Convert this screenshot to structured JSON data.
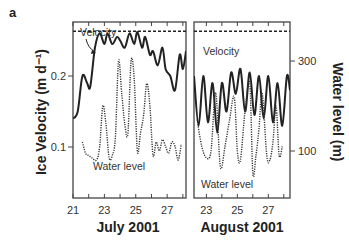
{
  "figure": {
    "panel_label": "a"
  },
  "chart_data": {
    "type": "line",
    "title": "",
    "panels": [
      {
        "name": "July 2001",
        "xlabel": "July 2001",
        "xticks": [
          21,
          23,
          25,
          27
        ],
        "xlim": [
          21,
          28.2
        ],
        "series": [
          {
            "name": "Velocity",
            "axis": "left",
            "style": "solid",
            "x": [
              21.0,
              21.3,
              21.6,
              21.9,
              22.1,
              22.4,
              22.7,
              23.0,
              23.2,
              23.5,
              23.8,
              24.0,
              24.3,
              24.6,
              24.9,
              25.1,
              25.4,
              25.6,
              25.9,
              26.1,
              26.4,
              26.7,
              26.9,
              27.2,
              27.5,
              27.8,
              28.0,
              28.2
            ],
            "values": [
              0.14,
              0.15,
              0.2,
              0.19,
              0.185,
              0.24,
              0.26,
              0.245,
              0.26,
              0.245,
              0.255,
              0.25,
              0.24,
              0.26,
              0.245,
              0.262,
              0.24,
              0.255,
              0.23,
              0.235,
              0.215,
              0.24,
              0.21,
              0.2,
              0.18,
              0.23,
              0.21,
              0.235
            ]
          },
          {
            "name": "Water level",
            "axis": "right",
            "style": "dotted",
            "x": [
              21.6,
              21.8,
              22.0,
              22.2,
              22.5,
              22.7,
              22.9,
              23.1,
              23.3,
              23.5,
              23.7,
              23.9,
              24.1,
              24.3,
              24.5,
              24.7,
              24.9,
              25.1,
              25.3,
              25.5,
              25.7,
              25.9,
              26.1,
              26.3,
              26.5,
              26.7,
              26.9,
              27.1,
              27.3,
              27.5,
              27.7,
              27.9
            ],
            "values": [
              120,
              95,
              90,
              85,
              80,
              110,
              200,
              160,
              85,
              90,
              130,
              300,
              230,
              160,
              140,
              300,
              260,
              100,
              140,
              180,
              250,
              200,
              90,
              120,
              100,
              125,
              110,
              95,
              120,
              110,
              80,
              115
            ]
          },
          {
            "name": "Velocity reference",
            "axis": "left",
            "style": "dashed",
            "x": [
              21,
              28.2
            ],
            "values": [
              0.263,
              0.263
            ]
          }
        ],
        "annotations": [
          "Velocity",
          "Water level"
        ]
      },
      {
        "name": "August 2001",
        "xlabel": "August 2001",
        "xticks": [
          23,
          25,
          27
        ],
        "xlim": [
          22.2,
          28.4
        ],
        "series": [
          {
            "name": "Velocity",
            "axis": "left",
            "style": "solid",
            "x": [
              22.2,
              22.5,
              22.8,
              23.1,
              23.4,
              23.7,
              24.0,
              24.3,
              24.6,
              24.9,
              25.2,
              25.5,
              25.8,
              26.1,
              26.4,
              26.7,
              27.0,
              27.3,
              27.6,
              27.9,
              28.2,
              28.4
            ],
            "values": [
              0.2,
              0.13,
              0.2,
              0.135,
              0.19,
              0.12,
              0.19,
              0.15,
              0.205,
              0.175,
              0.21,
              0.15,
              0.205,
              0.145,
              0.2,
              0.14,
              0.2,
              0.135,
              0.19,
              0.13,
              0.2,
              0.18
            ]
          },
          {
            "name": "Water level",
            "axis": "right",
            "style": "dotted",
            "x": [
              22.4,
              22.7,
              23.0,
              23.3,
              23.6,
              23.9,
              24.2,
              24.5,
              24.8,
              25.0,
              25.2,
              25.5,
              25.8,
              26.0,
              26.2,
              26.4,
              26.6,
              26.9,
              27.1,
              27.3,
              27.5,
              27.7,
              27.9
            ],
            "values": [
              170,
              110,
              85,
              100,
              230,
              65,
              110,
              170,
              220,
              100,
              80,
              190,
              250,
              50,
              90,
              150,
              230,
              90,
              80,
              120,
              200,
              90,
              110
            ]
          },
          {
            "name": "Velocity reference",
            "axis": "left",
            "style": "dashed",
            "x": [
              22.2,
              28.4
            ],
            "values": [
              0.263,
              0.263
            ]
          }
        ],
        "annotations": [
          "Velocity",
          "Water level"
        ]
      }
    ],
    "left_axis": {
      "label": "Ice Velocity (m d⁻¹)",
      "ticks": [
        0.1,
        0.2
      ],
      "tick_labels": [
        "0.1",
        "0.2"
      ]
    },
    "right_axis": {
      "label": "Water level (m)",
      "ticks": [
        100,
        300
      ],
      "tick_labels": [
        "100",
        "300"
      ]
    },
    "legend": "inline annotations",
    "grid": false
  },
  "labels": {
    "july_ticks": [
      "21",
      "23",
      "25",
      "27"
    ],
    "aug_ticks": [
      "23",
      "25",
      "27"
    ],
    "july_xlabel": "July 2001",
    "aug_xlabel": "August 2001",
    "left_ylabel": "Ice Velocity (m d⁻¹)",
    "right_ylabel": "Water level (m)",
    "left_ytick_02": "0.2",
    "left_ytick_01": "0.1",
    "right_ytick_300": "300",
    "right_ytick_100": "100",
    "velocity_annot_left": "Velocity",
    "water_annot_left": "Water level",
    "velocity_annot_right": "Velocity",
    "water_annot_right": "Water level"
  }
}
